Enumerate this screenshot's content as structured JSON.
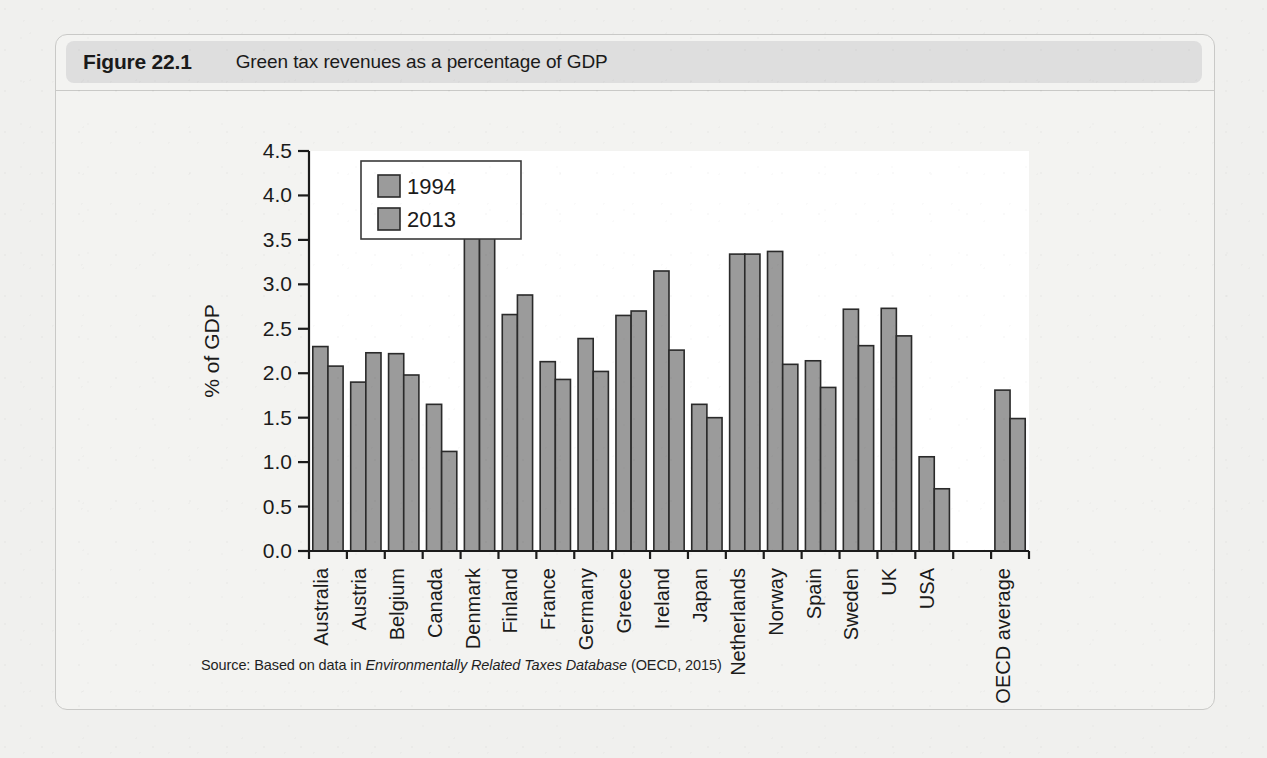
{
  "figure": {
    "number": "Figure 22.1",
    "title": "Green tax revenues as a percentage of GDP",
    "source_prefix": "Source: Based on data in ",
    "source_italic": "Environmentally Related Taxes Database",
    "source_suffix": " (OECD, 2015)"
  },
  "colors": {
    "bar_fill": "#9b9b9b",
    "bar_stroke": "#2a2a2a",
    "caption_pill": "#dedede",
    "page_background": "#f0f0ee",
    "plot_background": "#ffffff"
  },
  "chart_data": {
    "type": "bar",
    "title": "Green tax revenues as a percentage of GDP",
    "xlabel": "",
    "ylabel": "% of GDP",
    "ylim": [
      0.0,
      4.5
    ],
    "yticks": [
      "0.0",
      "0.5",
      "1.0",
      "1.5",
      "2.0",
      "2.5",
      "3.0",
      "3.5",
      "4.0",
      "4.5"
    ],
    "grid": false,
    "legend_position": "top-left-inside",
    "categories": [
      "Australia",
      "Austria",
      "Belgium",
      "Canada",
      "Denmark",
      "Finland",
      "France",
      "Germany",
      "Greece",
      "Ireland",
      "Japan",
      "Netherlands",
      "Norway",
      "Spain",
      "Sweden",
      "UK",
      "USA",
      "",
      "OECD average"
    ],
    "series": [
      {
        "name": "1994",
        "values": [
          2.3,
          1.9,
          2.22,
          1.65,
          3.98,
          2.66,
          2.13,
          2.39,
          2.65,
          3.15,
          1.65,
          3.34,
          3.37,
          2.14,
          2.72,
          2.73,
          1.06,
          null,
          1.81
        ]
      },
      {
        "name": "2013",
        "values": [
          2.08,
          2.23,
          1.98,
          1.12,
          3.91,
          2.88,
          1.93,
          2.02,
          2.7,
          2.26,
          1.5,
          3.34,
          2.1,
          1.84,
          2.31,
          2.42,
          0.7,
          null,
          1.49
        ]
      }
    ]
  }
}
